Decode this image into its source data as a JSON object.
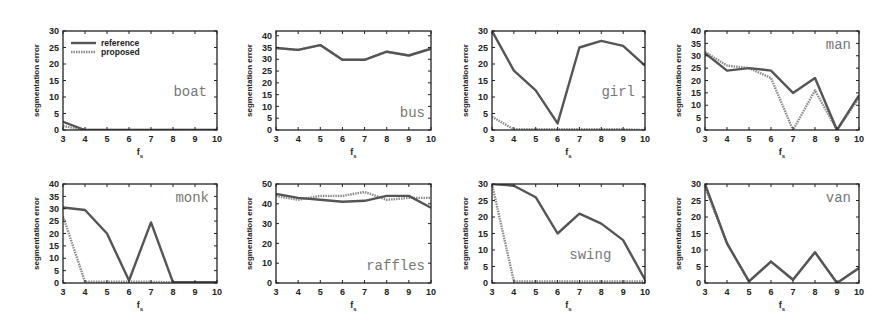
{
  "figure": {
    "legend": {
      "reference": "reference",
      "proposed": "proposed"
    },
    "colors": {
      "reference": "#555555",
      "proposed": "#8a8a8a",
      "frame": "#222222",
      "label": "#7a7a7a"
    }
  },
  "chart_data": [
    {
      "type": "line",
      "title": "boat",
      "xlabel": "f_s",
      "ylabel": "segmentation error",
      "x": [
        3,
        4,
        5,
        6,
        7,
        8,
        9,
        10
      ],
      "ylim": [
        0,
        30
      ],
      "yticks": [
        0,
        5,
        10,
        15,
        20,
        25,
        30
      ],
      "label_pos": "right-mid",
      "legend": true,
      "series": [
        {
          "name": "reference",
          "values": [
            2.5,
            0,
            0,
            0,
            0,
            0,
            0,
            0
          ]
        },
        {
          "name": "proposed",
          "values": [
            1.2,
            0,
            0,
            0,
            0,
            0,
            0,
            0
          ]
        }
      ]
    },
    {
      "type": "line",
      "title": "bus",
      "xlabel": "f_s",
      "ylabel": "segmentation error",
      "x": [
        3,
        4,
        5,
        6,
        7,
        8,
        9,
        10
      ],
      "ylim": [
        0,
        42
      ],
      "yticks": [
        0,
        5,
        10,
        15,
        20,
        25,
        30,
        35,
        40
      ],
      "label_pos": "right-bottom",
      "series": [
        {
          "name": "reference",
          "values": [
            34.8,
            34,
            36,
            29.8,
            29.8,
            33.2,
            31.6,
            34.5
          ]
        },
        {
          "name": "proposed",
          "values": [
            34.8,
            34,
            36,
            29.8,
            29.8,
            33.2,
            31.6,
            34.5
          ]
        }
      ]
    },
    {
      "type": "line",
      "title": "girl",
      "xlabel": "f_s",
      "ylabel": "segmentation error",
      "x": [
        3,
        4,
        5,
        6,
        7,
        8,
        9,
        10
      ],
      "ylim": [
        0,
        30
      ],
      "yticks": [
        0,
        5,
        10,
        15,
        20,
        25,
        30
      ],
      "label_pos": "right-mid",
      "series": [
        {
          "name": "reference",
          "values": [
            30,
            18,
            12,
            2,
            25,
            27,
            25.5,
            19.5
          ]
        },
        {
          "name": "proposed",
          "values": [
            4,
            0.2,
            0.2,
            0.2,
            0.2,
            0.2,
            0.2,
            0
          ]
        }
      ]
    },
    {
      "type": "line",
      "title": "man",
      "xlabel": "f_s",
      "ylabel": "segmentation error",
      "x": [
        3,
        4,
        5,
        6,
        7,
        8,
        9,
        10
      ],
      "ylim": [
        0,
        40
      ],
      "yticks": [
        0,
        5,
        10,
        15,
        20,
        25,
        30,
        35,
        40
      ],
      "label_pos": "right-top",
      "series": [
        {
          "name": "reference",
          "values": [
            31,
            24,
            25,
            24,
            15,
            21,
            0,
            14
          ]
        },
        {
          "name": "proposed",
          "values": [
            31.5,
            26,
            25,
            21,
            0,
            16,
            0,
            13
          ]
        }
      ]
    },
    {
      "type": "line",
      "title": "monk",
      "xlabel": "f_s",
      "ylabel": "segmentation error",
      "x": [
        3,
        4,
        5,
        6,
        7,
        8,
        9,
        10
      ],
      "ylim": [
        0,
        40
      ],
      "yticks": [
        0,
        5,
        10,
        15,
        20,
        25,
        30,
        35,
        40
      ],
      "label_pos": "right-top",
      "series": [
        {
          "name": "reference",
          "values": [
            30.5,
            29.5,
            20,
            1,
            24.5,
            0.3,
            0.3,
            0.3
          ]
        },
        {
          "name": "proposed",
          "values": [
            27,
            0.5,
            0.5,
            0.5,
            0.5,
            0.3,
            0.3,
            0.3
          ]
        }
      ]
    },
    {
      "type": "line",
      "title": "raffles",
      "xlabel": "f_s",
      "ylabel": "segmentation error",
      "x": [
        3,
        4,
        5,
        6,
        7,
        8,
        9,
        10
      ],
      "ylim": [
        0,
        50
      ],
      "yticks": [
        0,
        10,
        20,
        30,
        40,
        50
      ],
      "label_pos": "right-bottom",
      "series": [
        {
          "name": "reference",
          "values": [
            45,
            43,
            42,
            41,
            41.5,
            44,
            44,
            38
          ]
        },
        {
          "name": "proposed",
          "values": [
            44,
            42,
            44,
            44,
            46,
            42,
            43,
            43
          ]
        }
      ]
    },
    {
      "type": "line",
      "title": "swing",
      "xlabel": "f_s",
      "ylabel": "segmentation error",
      "x": [
        3,
        4,
        5,
        6,
        7,
        8,
        9,
        10
      ],
      "ylim": [
        0,
        30
      ],
      "yticks": [
        0,
        5,
        10,
        15,
        20,
        25,
        30
      ],
      "label_pos": "center-low",
      "series": [
        {
          "name": "reference",
          "values": [
            34,
            29.5,
            26,
            15,
            21,
            18,
            13,
            1
          ]
        },
        {
          "name": "proposed",
          "values": [
            34,
            0.5,
            0.5,
            0.5,
            0.5,
            0.5,
            0.5,
            0.5
          ]
        }
      ]
    },
    {
      "type": "line",
      "title": "van",
      "xlabel": "f_s",
      "ylabel": "segmentation error",
      "x": [
        3,
        4,
        5,
        6,
        7,
        8,
        9,
        10
      ],
      "ylim": [
        0,
        30
      ],
      "yticks": [
        0,
        5,
        10,
        15,
        20,
        25,
        30
      ],
      "label_pos": "right-top",
      "series": [
        {
          "name": "reference",
          "values": [
            30,
            12,
            0.5,
            6.5,
            1,
            9.3,
            0,
            4.5
          ]
        },
        {
          "name": "proposed",
          "values": [
            29,
            12,
            0.5,
            6.5,
            1,
            9.3,
            0,
            4.5
          ]
        }
      ]
    }
  ],
  "layout": {
    "frames": [
      {
        "x": 63,
        "y": 31,
        "w": 154,
        "h": 99
      },
      {
        "x": 276,
        "y": 31,
        "w": 155,
        "h": 99
      },
      {
        "x": 492,
        "y": 31,
        "w": 153,
        "h": 99
      },
      {
        "x": 705,
        "y": 31,
        "w": 154,
        "h": 99
      },
      {
        "x": 63,
        "y": 184,
        "w": 154,
        "h": 99
      },
      {
        "x": 276,
        "y": 184,
        "w": 155,
        "h": 99
      },
      {
        "x": 492,
        "y": 184,
        "w": 153,
        "h": 99
      },
      {
        "x": 705,
        "y": 184,
        "w": 154,
        "h": 99
      }
    ]
  }
}
